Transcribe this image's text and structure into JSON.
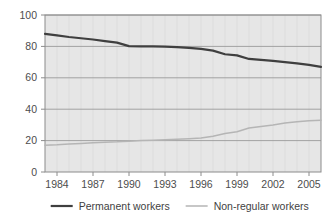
{
  "chart_data": {
    "type": "line",
    "title": "",
    "subtitle": "",
    "xlabel": "",
    "ylabel": "",
    "xlim": [
      1983,
      2006
    ],
    "ylim": [
      0,
      100
    ],
    "yticks": [
      0,
      20,
      40,
      60,
      80,
      100
    ],
    "ytick_labels": [
      "0",
      "20",
      "40",
      "60",
      "80",
      "100"
    ],
    "xticks": [
      1984,
      1987,
      1990,
      1993,
      1996,
      1999,
      2002,
      2005
    ],
    "xtick_labels": [
      "1984",
      "1987",
      "1990",
      "1993",
      "1996",
      "1999",
      "2002",
      "2005"
    ],
    "grid": true,
    "grid_axis": "both",
    "legend_position": "bottom",
    "plot_background": "#e6e6e6",
    "x": [
      1983,
      1984,
      1985,
      1986,
      1987,
      1988,
      1989,
      1990,
      1991,
      1992,
      1993,
      1994,
      1995,
      1996,
      1997,
      1998,
      1999,
      2000,
      2001,
      2002,
      2003,
      2004,
      2005,
      2006
    ],
    "series": [
      {
        "name": "Permanent workers",
        "color": "#3f3f3f",
        "width": 2.2,
        "values": [
          88.0,
          87.0,
          86.0,
          85.2,
          84.4,
          83.4,
          82.4,
          80.2,
          80.0,
          80.0,
          79.9,
          79.5,
          79.0,
          78.4,
          77.3,
          75.0,
          74.3,
          72.0,
          71.4,
          70.8,
          70.0,
          69.2,
          68.2,
          67.0
        ]
      },
      {
        "name": "Non-regular workers",
        "color": "#b5b5b5",
        "width": 1.5,
        "values": [
          17.0,
          17.3,
          17.8,
          18.2,
          18.6,
          19.0,
          19.2,
          19.6,
          20.0,
          20.3,
          20.5,
          20.8,
          21.2,
          21.6,
          22.8,
          24.5,
          25.6,
          28.0,
          29.0,
          30.0,
          31.2,
          32.0,
          32.6,
          33.0
        ]
      }
    ],
    "legend": [
      {
        "label": "Permanent workers",
        "color": "#3f3f3f",
        "width": 2.2
      },
      {
        "label": "Non-regular workers",
        "color": "#b5b5b5",
        "width": 1.5
      }
    ],
    "axis_line_color": "#8c8c8c",
    "gridline_color": "#9a9a9a"
  }
}
